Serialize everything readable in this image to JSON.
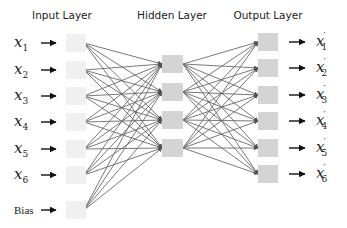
{
  "diagram": {
    "type": "autoencoder-neural-network",
    "layers": [
      {
        "title": "Input Layer",
        "title_x": 62,
        "nodes": [
          {
            "label": "x",
            "sub": "1",
            "y": 43
          },
          {
            "label": "x",
            "sub": "2",
            "y": 70
          },
          {
            "label": "x",
            "sub": "3",
            "y": 96
          },
          {
            "label": "x",
            "sub": "4",
            "y": 122
          },
          {
            "label": "x",
            "sub": "5",
            "y": 149
          },
          {
            "label": "x",
            "sub": "6",
            "y": 175
          },
          {
            "label": "Bias",
            "sub": "",
            "y": 210,
            "bias": true
          }
        ],
        "box": {
          "x": 66,
          "w": 20,
          "h": 18,
          "fill": "#f0f0f0"
        }
      },
      {
        "title": "Hidden Layer",
        "title_x": 172,
        "nodes": [
          {
            "y": 64
          },
          {
            "y": 92
          },
          {
            "y": 120
          },
          {
            "y": 148
          }
        ],
        "box": {
          "x": 162,
          "w": 21,
          "h": 18,
          "fill": "#d4d4d4"
        }
      },
      {
        "title": "Output Layer",
        "title_x": 268,
        "nodes": [
          {
            "label": "x",
            "sub": "1",
            "prime": true,
            "y": 42
          },
          {
            "label": "x",
            "sub": "2",
            "prime": true,
            "y": 68
          },
          {
            "label": "x",
            "sub": "3",
            "prime": true,
            "y": 95
          },
          {
            "label": "x",
            "sub": "4",
            "prime": true,
            "y": 121
          },
          {
            "label": "x",
            "sub": "5",
            "prime": true,
            "y": 148
          },
          {
            "label": "x",
            "sub": "6",
            "prime": true,
            "y": 174
          }
        ],
        "box": {
          "x": 258,
          "w": 20,
          "h": 18,
          "fill": "#d4d4d4"
        }
      }
    ],
    "colors": {
      "edge": "#6a6a6a",
      "arrow": "#111111",
      "text": "#222222"
    }
  }
}
